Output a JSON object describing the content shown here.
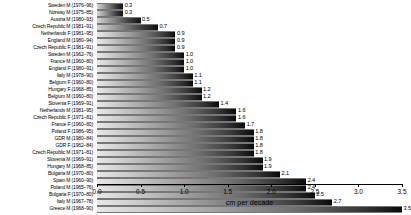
{
  "chart_data": {
    "type": "bar",
    "orientation": "horizontal",
    "title": "",
    "xlabel": "cm per decade",
    "ylabel": "",
    "xlim": [
      0.0,
      3.5
    ],
    "xticks": [
      "0.0",
      "0.5",
      "1.0",
      "1.5",
      "2.0",
      "2.5",
      "3.0",
      "3.5"
    ],
    "xtick_values": [
      0.0,
      0.5,
      1.0,
      1.5,
      2.0,
      2.5,
      3.0,
      3.5
    ],
    "grid": false,
    "legend": null,
    "categories": [
      "Sweden M (1976–96)",
      "Norway M (1975–85)",
      "Austria M (1980–93)",
      "Czech Republic M (1981–91)",
      "Netherlands F (1981–95)",
      "England M (1980–94)",
      "Czech Republic F (1981–91)",
      "Sweden M (1962–76)",
      "France M (1960–80)",
      "England F (1980–91)",
      "Italy M (1978–90)",
      "Belgium F (1960–80)",
      "Hungary F (1968–85)",
      "Belgium M (1960–80)",
      "Slovenia F (1969–91)",
      "Netherlands M (1981–95)",
      "Czech Republic F (1971–81)",
      "France F (1960–80)",
      "Poland F (1986–95)",
      "GDR M (1980–84)",
      "GDR F (1962–84)",
      "Czech Republic M (1971–81)",
      "Slovenia M (1969–91)",
      "Hungary M (1968–85)",
      "Bulgaria M (1970–80)",
      "Spain M (1960–90)",
      "Poland M (1965–76)",
      "Bulgaria F (1970–80)",
      "Italy M (1967–78)",
      "Greece M (1968–90)"
    ],
    "values": [
      0.3,
      0.3,
      0.5,
      0.7,
      0.9,
      0.9,
      0.9,
      1.0,
      1.0,
      1.0,
      1.1,
      1.1,
      1.2,
      1.2,
      1.4,
      1.6,
      1.6,
      1.7,
      1.8,
      1.8,
      1.8,
      1.8,
      1.9,
      1.9,
      2.1,
      2.4,
      2.4,
      2.5,
      2.7,
      3.5
    ],
    "value_labels": [
      "0.3",
      "0.3",
      "0.5",
      "0.7",
      "0.9",
      "0.9",
      "0.9",
      "1.0",
      "1.0",
      "1.0",
      "1.1",
      "1.1",
      "1.2",
      "1.2",
      "1.4",
      "1.6",
      "1.6",
      "1.7",
      "1.8",
      "1.8",
      "1.8",
      "1.8",
      "1.9",
      "1.9",
      "2.1",
      "2.4",
      "2.4",
      "2.5",
      "2.7",
      "3.5"
    ],
    "colors": {
      "bar_gradient_start": "#e8e8e8",
      "bar_gradient_end": "#0a0a0a",
      "axis": "#000000",
      "text": "#000000",
      "background": "#ffffff"
    }
  }
}
